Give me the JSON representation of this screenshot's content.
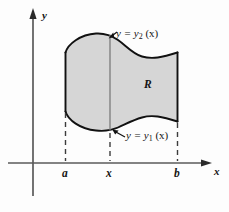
{
  "figure": {
    "kind": "math-diagram",
    "axes": {
      "y_axis_label": "y",
      "x_axis_label": "x",
      "origin": {
        "x": 33,
        "y": 163
      }
    },
    "ticks": [
      {
        "name": "a",
        "label": "a",
        "x": 66
      },
      {
        "name": "x",
        "label": "x",
        "x": 110
      },
      {
        "name": "b",
        "label": "b",
        "x": 178
      }
    ],
    "region": {
      "label": "R",
      "fill_color": "#d6d6d6",
      "stroke_color": "#111111"
    },
    "curves": [
      {
        "name": "upper-curve",
        "label_text": "y = y",
        "label_sub": "2",
        "label_arg": " (x)",
        "full_label": "y = y2 (x)"
      },
      {
        "name": "lower-curve",
        "label_text": "y = y",
        "label_sub": "1",
        "label_arg": " (x)",
        "full_label": "y = y1 (x)"
      }
    ],
    "guides": {
      "dashed_color": "#4a4a4a",
      "vertical_slice_color": "#6b6b6b"
    }
  }
}
